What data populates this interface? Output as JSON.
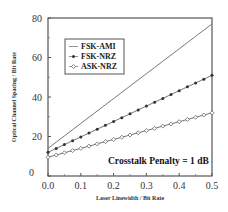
{
  "chart_data": {
    "type": "line",
    "title": "",
    "xlabel": "Laser Linewidth / Bit Rate",
    "ylabel": "Optical Channel Spacing / Bit Rate",
    "xlim": [
      0.0,
      0.5
    ],
    "ylim": [
      0,
      80
    ],
    "xticks": [
      "0.0",
      "0.1",
      "0.2",
      "0.3",
      "0.4",
      "0.5"
    ],
    "yticks": [
      "0",
      "20",
      "40",
      "60",
      "80"
    ],
    "grid": false,
    "legend_position": "upper left",
    "annotation": "Crosstalk Penalty = 1 dB",
    "x": [
      0.0,
      0.025,
      0.05,
      0.075,
      0.1,
      0.125,
      0.15,
      0.175,
      0.2,
      0.225,
      0.25,
      0.275,
      0.3,
      0.325,
      0.35,
      0.375,
      0.4,
      0.425,
      0.45,
      0.475,
      0.5
    ],
    "series": [
      {
        "name": "FSK-AMI",
        "marker": "none",
        "start": 14,
        "end": 77
      },
      {
        "name": "FSK-NRZ",
        "marker": "filled-circle",
        "start": 12,
        "end": 51
      },
      {
        "name": "ASK-NRZ",
        "marker": "open-diamond",
        "start": 9.5,
        "end": 32
      }
    ]
  }
}
